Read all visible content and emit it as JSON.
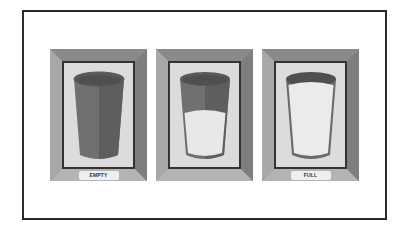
{
  "figure": {
    "panels": [
      {
        "label": "EMPTY",
        "fill": "empty",
        "fill_fraction": 0
      },
      {
        "label": "",
        "fill": "half",
        "fill_fraction": 0.55
      },
      {
        "label": "FULL",
        "fill": "full",
        "fill_fraction": 1
      }
    ],
    "colors": {
      "frame": "#2b2b2b",
      "glass": "#6e6e6e",
      "glass_dark": "#5a5a5a",
      "liquid": "#e8e8e8",
      "panel_bg": "#dcdcdc"
    }
  }
}
